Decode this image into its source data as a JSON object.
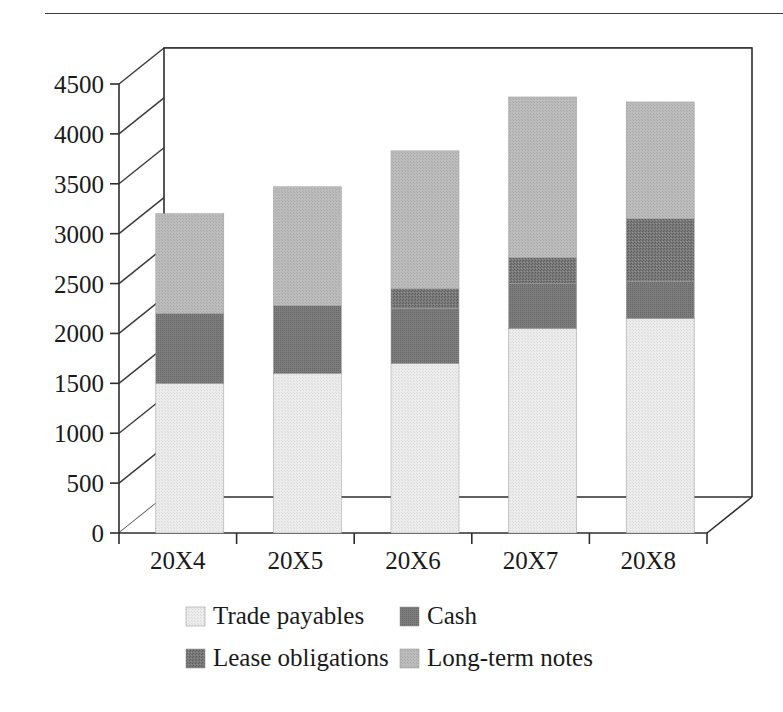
{
  "caption": {
    "cut_text": "fragment"
  },
  "chart_data": {
    "type": "bar",
    "subtype": "stacked-column-3d",
    "title": "",
    "xlabel": "",
    "ylabel": "",
    "categories": [
      "20X4",
      "20X5",
      "20X6",
      "20X7",
      "20X8"
    ],
    "ylim": [
      0,
      4500
    ],
    "ytick_step": 500,
    "ytick_labels": [
      "0",
      "500",
      "1000",
      "1500",
      "2000",
      "2500",
      "3000",
      "3500",
      "4000",
      "4500"
    ],
    "ytick_values": [
      0,
      500,
      1000,
      1500,
      2000,
      2500,
      3000,
      3500,
      4000,
      4500
    ],
    "grid": true,
    "legend_position": "bottom",
    "series": [
      {
        "name": "Trade payables",
        "color": "#e7e7e7",
        "values": [
          1500,
          1600,
          1700,
          2050,
          2150
        ]
      },
      {
        "name": "Cash",
        "color": "#7d7d7d",
        "values": [
          700,
          680,
          550,
          450,
          370
        ]
      },
      {
        "name": "Lease obligations",
        "color": "#6f6f6f",
        "values": [
          0,
          0,
          200,
          260,
          630
        ]
      },
      {
        "name": "Long-term notes",
        "color": "#b6b6b6",
        "values": [
          1000,
          1190,
          1380,
          1610,
          1170
        ]
      }
    ],
    "series_totals": [
      3200,
      3470,
      3830,
      4370,
      4320
    ],
    "cumulative_tops": [
      [
        1500,
        2200,
        2200,
        3200
      ],
      [
        1600,
        2280,
        2280,
        3470
      ],
      [
        1700,
        2250,
        2450,
        3830
      ],
      [
        2050,
        2500,
        2760,
        4370
      ],
      [
        2150,
        2520,
        3150,
        4320
      ]
    ]
  },
  "legend": {
    "entries": [
      {
        "label": "Trade payables",
        "color": "#e7e7e7"
      },
      {
        "label": "Cash",
        "color": "#7d7d7d"
      },
      {
        "label": "Lease obligations",
        "color": "#6f6f6f"
      },
      {
        "label": "Long-term notes",
        "color": "#b6b6b6"
      }
    ]
  },
  "colors": {
    "background": "#ffffff",
    "axis": "#2d2d2d",
    "grid": "#3a3a3a",
    "text": "#1a1a1a"
  }
}
